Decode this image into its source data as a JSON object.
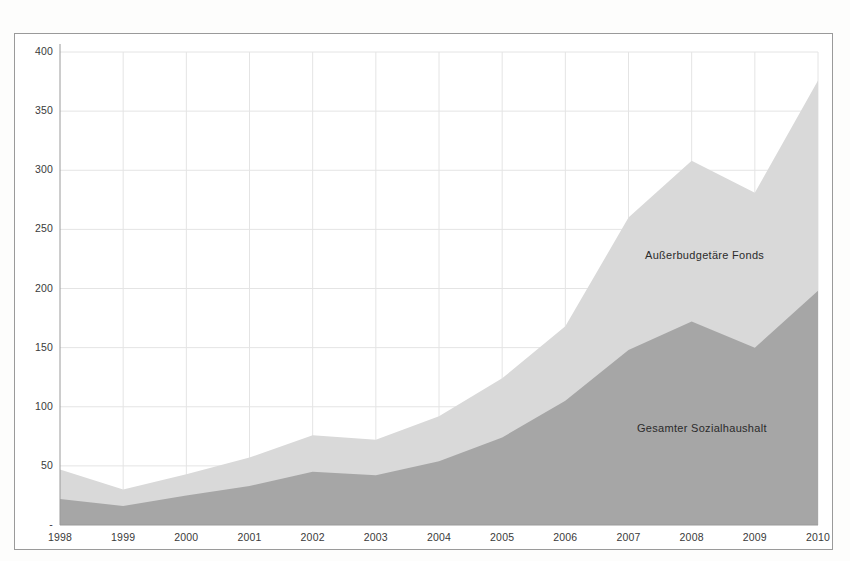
{
  "chart_data": {
    "type": "area",
    "stacked": true,
    "title": "",
    "subtitle": "",
    "xlabel": "",
    "ylabel": "",
    "categories": [
      "1998",
      "1999",
      "2000",
      "2001",
      "2002",
      "2003",
      "2004",
      "2005",
      "2006",
      "2007",
      "2008",
      "2009",
      "2010"
    ],
    "x": [
      1998,
      1999,
      2000,
      2001,
      2002,
      2003,
      2004,
      2005,
      2006,
      2007,
      2008,
      2009,
      2010
    ],
    "series": [
      {
        "name": "Gesamter Sozialhaushalt",
        "color": "#a6a6a6",
        "values": [
          22,
          16,
          25,
          33,
          45,
          42,
          54,
          74,
          105,
          148,
          172,
          150,
          198
        ]
      },
      {
        "name": "Außerbudgetäre Fonds",
        "color": "#d9d9d9",
        "values": [
          25,
          14,
          18,
          24,
          31,
          30,
          38,
          50,
          63,
          112,
          136,
          131,
          178
        ]
      }
    ],
    "stacked_totals": [
      47,
      30,
      43,
      57,
      76,
      72,
      92,
      124,
      168,
      260,
      308,
      281,
      376
    ],
    "ylim": [
      0,
      400
    ],
    "ytick_values": [
      0,
      50,
      100,
      150,
      200,
      250,
      300,
      350,
      400
    ],
    "ytick_labels": [
      "-",
      "50",
      "100",
      "150",
      "200",
      "250",
      "300",
      "350",
      "400"
    ],
    "xtick_labels": [
      "1998",
      "1999",
      "2000",
      "2001",
      "2002",
      "2003",
      "2004",
      "2005",
      "2006",
      "2007",
      "2008",
      "2009",
      "2010"
    ],
    "grid": {
      "horizontal": true,
      "vertical": true,
      "color": "#e4e4e4"
    },
    "legend": {
      "position": "inline-annotations"
    },
    "annotations": [
      {
        "text": "Außerbudgetäre Fonds",
        "x": 2006.6,
        "y": 225
      },
      {
        "text": "Gesamter Sozialhaushalt",
        "x": 2006.5,
        "y": 80
      }
    ],
    "axis_color": "#9a9a9a",
    "frame_color": "#9a9a9a",
    "background": "#ffffff"
  },
  "labels": {
    "series_upper": "Außerbudgetäre Fonds",
    "series_lower": "Gesamter Sozialhaushalt"
  }
}
